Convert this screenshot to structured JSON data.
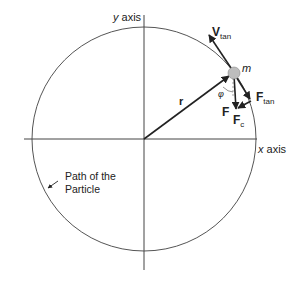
{
  "diagram": {
    "circle": {
      "cx": 144,
      "cy": 139,
      "r": 112,
      "stroke": "#555555"
    },
    "axes": {
      "x": {
        "label_var": "x",
        "label_word": "axis",
        "x1": 24,
        "x2": 257,
        "y": 139
      },
      "y": {
        "label_var": "y",
        "label_word": "axis",
        "x": 144,
        "y1": 15,
        "y2": 270
      }
    },
    "particle": {
      "label": "m",
      "cx": 234,
      "cy": 73,
      "r": 6,
      "fill": "#bdbdbd"
    },
    "vectors": {
      "r": {
        "label": "r"
      },
      "v_tan": {
        "label_main": "V",
        "label_sub": "tan"
      },
      "f": {
        "label": "F"
      },
      "f_tan": {
        "label_main": "F",
        "label_sub": "tan"
      },
      "f_c": {
        "label_main": "F",
        "label_sub": "c"
      }
    },
    "angle": {
      "label": "φ"
    },
    "path_label": {
      "line1": "Path of the",
      "line2": "Particle"
    },
    "colors": {
      "line": "#222222",
      "circle": "#555555",
      "particle": "#bdbdbd"
    }
  }
}
